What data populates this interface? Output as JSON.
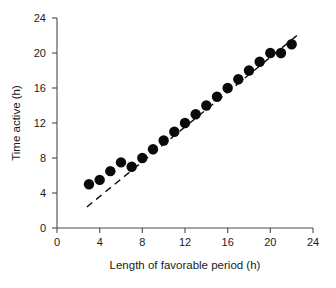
{
  "chart_data": {
    "type": "scatter",
    "title": "",
    "xlabel": "Length of favorable period (h)",
    "ylabel": "Time active (h)",
    "xlim": [
      0,
      24
    ],
    "ylim": [
      0,
      24
    ],
    "xticks": [
      0,
      4,
      8,
      12,
      16,
      20,
      24
    ],
    "yticks": [
      0,
      4,
      8,
      12,
      16,
      20,
      24
    ],
    "xtick_labels": [
      "0",
      "4",
      "8",
      "12",
      "16",
      "20",
      "24"
    ],
    "ytick_labels": [
      "0",
      "4",
      "8",
      "12",
      "16",
      "20",
      "24"
    ],
    "grid": false,
    "legend": null,
    "series": [
      {
        "name": "Time active vs favorable period",
        "marker": "filled-circle",
        "marker_color": "#0a0a0a",
        "marker_size": 8,
        "x": [
          3,
          4,
          5,
          6,
          7,
          8,
          9,
          10,
          11,
          12,
          13,
          14,
          15,
          16,
          17,
          18,
          19,
          20,
          21,
          22
        ],
        "y": [
          5,
          5.5,
          6.5,
          7.5,
          7,
          8,
          9,
          10,
          11,
          12,
          13,
          14,
          15,
          16,
          17,
          18,
          19,
          20,
          20,
          21
        ]
      }
    ],
    "reference_line": {
      "name": "identity-dashed-line",
      "style": "dashed",
      "color": "#0a0a0a",
      "x": [
        2.8,
        22.8
      ],
      "y": [
        2.4,
        22.3
      ]
    }
  },
  "axes": {
    "x_title": "Length of favorable period (h)",
    "y_title": "Time active (h)"
  }
}
